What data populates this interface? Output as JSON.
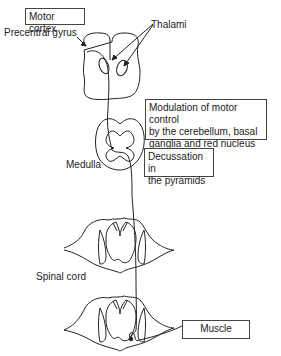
{
  "diagram": {
    "title_box": "Motor cortex",
    "labels": {
      "precentral_gyrus": "Precentral gyrus",
      "thalami": "Thalami",
      "medulla": "Medulla",
      "spinal_cord": "Spinal cord"
    },
    "boxes": {
      "modulation": [
        "Modulation of motor control",
        "by the cerebellum, basal",
        "ganglia and red nucleus"
      ],
      "decussation": [
        "Decussation in",
        "the pyramids"
      ],
      "muscle": "Muscle"
    }
  }
}
